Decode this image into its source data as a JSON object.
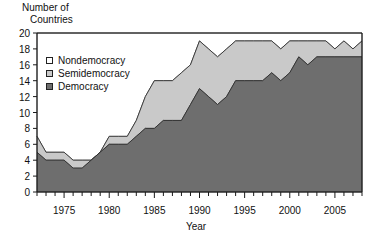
{
  "chart_data": {
    "type": "area",
    "stacked": true,
    "title": "",
    "ylabel": "Number of\nCountries",
    "ylabel_lines": [
      "Number of",
      "Countries"
    ],
    "xlabel": "Year",
    "ylim": [
      0,
      20
    ],
    "ytick_step": 2,
    "yticks": [
      0,
      2,
      4,
      6,
      8,
      10,
      12,
      14,
      16,
      18,
      20
    ],
    "xlim": [
      1972,
      2008
    ],
    "xticks_labeled": [
      1975,
      1980,
      1985,
      1990,
      1995,
      2000,
      2005
    ],
    "xtick_minor_step": 1,
    "grid": false,
    "legend_position": "upper-left-inside",
    "x": [
      1972,
      1973,
      1974,
      1975,
      1976,
      1977,
      1978,
      1979,
      1980,
      1981,
      1982,
      1983,
      1984,
      1985,
      1986,
      1987,
      1988,
      1989,
      1990,
      1991,
      1992,
      1993,
      1994,
      1995,
      1996,
      1997,
      1998,
      1999,
      2000,
      2001,
      2002,
      2003,
      2004,
      2005,
      2006,
      2007,
      2008
    ],
    "series": [
      {
        "name": "Democracy",
        "color": "#6e6e6e",
        "values": [
          5,
          4,
          4,
          4,
          3,
          3,
          4,
          5,
          6,
          6,
          6,
          7,
          8,
          8,
          9,
          9,
          9,
          11,
          13,
          12,
          11,
          12,
          14,
          14,
          14,
          14,
          15,
          14,
          15,
          17,
          16,
          17,
          17,
          17,
          17,
          17,
          17
        ]
      },
      {
        "name": "Semidemocracy",
        "color": "#c9c9c9",
        "values": [
          2,
          1,
          1,
          1,
          1,
          1,
          0,
          0,
          1,
          1,
          1,
          2,
          4,
          6,
          5,
          5,
          6,
          5,
          6,
          6,
          6,
          6,
          5,
          5,
          5,
          5,
          4,
          4,
          4,
          2,
          3,
          2,
          2,
          1,
          2,
          1,
          2
        ]
      },
      {
        "name": "Nondemocracy",
        "color": "#ffffff",
        "values": [
          13,
          15,
          15,
          15,
          16,
          16,
          16,
          15,
          13,
          13,
          13,
          11,
          8,
          6,
          6,
          6,
          5,
          4,
          1,
          2,
          3,
          2,
          1,
          1,
          1,
          1,
          1,
          2,
          1,
          1,
          1,
          1,
          1,
          2,
          1,
          2,
          1
        ]
      }
    ],
    "cumulative_democracy": [
      5,
      4,
      4,
      4,
      3,
      3,
      4,
      5,
      6,
      6,
      6,
      7,
      8,
      8,
      9,
      9,
      9,
      11,
      13,
      12,
      11,
      12,
      14,
      14,
      14,
      14,
      15,
      14,
      15,
      17,
      16,
      17,
      17,
      17,
      17,
      17,
      17
    ],
    "cumulative_democracy_plus_semi": [
      7,
      5,
      5,
      5,
      4,
      4,
      4,
      5,
      7,
      7,
      7,
      9,
      12,
      14,
      14,
      14,
      15,
      16,
      19,
      18,
      17,
      18,
      19,
      19,
      19,
      19,
      19,
      18,
      19,
      19,
      19,
      19,
      19,
      18,
      19,
      18,
      19
    ],
    "total": 20
  },
  "legend": {
    "items": [
      {
        "label": "Nondemocracy",
        "swatch": "white"
      },
      {
        "label": "Semidemocracy",
        "swatch": "light-gray"
      },
      {
        "label": "Democracy",
        "swatch": "dark-gray"
      }
    ]
  },
  "colors": {
    "democracy": "#6e6e6e",
    "semidemocracy": "#c9c9c9",
    "nondemocracy": "#ffffff",
    "axis": "#1a1a1a",
    "text": "#111111"
  }
}
